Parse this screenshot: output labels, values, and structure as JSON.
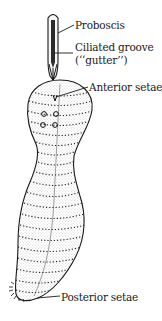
{
  "figure": {
    "labels": [
      {
        "id": "proboscis",
        "text": "Proboscis"
      },
      {
        "id": "ciliated_groove",
        "text": "Ciliated groove"
      },
      {
        "id": "gutter",
        "text": "(‘‘gutter’’)"
      },
      {
        "id": "anterior_setae",
        "text": "Anterior setae"
      },
      {
        "id": "posterior_setae",
        "text": "Posterior setae"
      }
    ],
    "colors": {
      "ink": "#1a1a1a",
      "background": "#ffffff",
      "groove": "#2b2b2b"
    }
  }
}
